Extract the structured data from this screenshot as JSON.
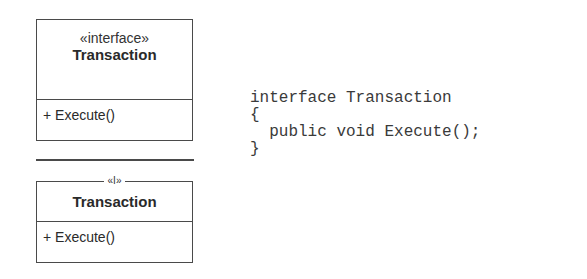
{
  "diagram": {
    "box_full": {
      "stereotype": "«interface»",
      "class_name": "Transaction",
      "operations": [
        "+ Execute()"
      ]
    },
    "box_abbrev": {
      "stereotype_mark": "«I»",
      "class_name": "Transaction",
      "operations": [
        "+ Execute()"
      ]
    },
    "code": {
      "lines": [
        "interface Transaction",
        "{",
        "  public void Execute();",
        "}"
      ]
    }
  }
}
